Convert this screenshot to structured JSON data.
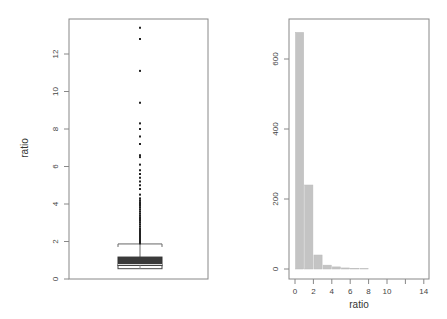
{
  "chart_data": [
    {
      "type": "boxplot",
      "title": "",
      "xlabel": "",
      "ylabel": "ratio",
      "ylim": [
        0,
        13.5
      ],
      "yticks": [
        0,
        2,
        4,
        6,
        8,
        10,
        12
      ],
      "grid": false,
      "stats": {
        "min": 0.5,
        "q1": 0.55,
        "median": 0.72,
        "q3": 1.17,
        "whisker_high": 1.87
      },
      "outliers": [
        1.9,
        2.0,
        2.1,
        2.2,
        2.3,
        2.4,
        2.5,
        2.6,
        2.7,
        2.8,
        2.9,
        3.0,
        3.1,
        3.2,
        3.3,
        3.4,
        3.5,
        3.6,
        3.7,
        3.8,
        3.9,
        4.0,
        4.1,
        4.2,
        4.3,
        4.5,
        4.8,
        5.0,
        5.2,
        5.4,
        5.6,
        5.8,
        6.1,
        6.5,
        6.6,
        7.2,
        7.6,
        8.0,
        8.3,
        9.4,
        11.1,
        12.8,
        13.4
      ],
      "color": "#333333"
    },
    {
      "type": "bar",
      "title": "",
      "xlabel": "ratio",
      "ylabel": "",
      "xlim": [
        0,
        14
      ],
      "ylim": [
        0,
        680
      ],
      "xticks": [
        0,
        2,
        4,
        6,
        8,
        10,
        12,
        14
      ],
      "xtick_labels": [
        "0",
        "2",
        "4",
        "6",
        "8",
        "10",
        "",
        "14"
      ],
      "yticks": [
        0,
        200,
        400,
        600
      ],
      "grid": false,
      "categories": [
        "0-1",
        "1-2",
        "2-3",
        "3-4",
        "4-5",
        "5-6",
        "6-7",
        "7-8"
      ],
      "values": [
        676,
        240,
        40,
        11,
        6,
        3,
        2,
        1
      ],
      "color": "#c4c4c4"
    }
  ],
  "left": {
    "ylabel": "ratio",
    "yticks": [
      "0",
      "2",
      "4",
      "6",
      "8",
      "10",
      "12"
    ]
  },
  "right": {
    "xlabel": "ratio",
    "yticks": [
      "0",
      "200",
      "400",
      "600"
    ],
    "xticks": [
      "0",
      "2",
      "4",
      "6",
      "8",
      "10",
      "",
      "14"
    ]
  }
}
